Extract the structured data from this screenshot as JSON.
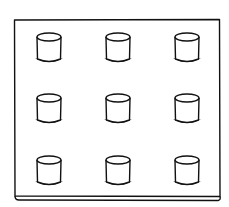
{
  "figure": {
    "stroke_color": "#111111",
    "background": "#ffffff",
    "board": {
      "x": 14,
      "y": 20,
      "width": 206,
      "height": 176,
      "thickness": 4
    },
    "grid": {
      "rows": 3,
      "cols": 3
    },
    "peg_columns_x": [
      49,
      118,
      187
    ],
    "peg_rows_top_y": [
      33,
      94,
      156
    ],
    "peg": {
      "top_rx": 12,
      "top_ry": 4,
      "height": 22,
      "bottom_half_width": 14
    }
  }
}
